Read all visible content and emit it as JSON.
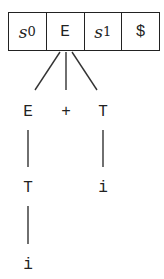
{
  "stack": {
    "cells": [
      {
        "kind": "state",
        "base": "s",
        "sub": "0"
      },
      {
        "kind": "symbol",
        "text": "E"
      },
      {
        "kind": "state",
        "base": "s",
        "sub": "1"
      },
      {
        "kind": "symbol",
        "text": "$"
      }
    ]
  },
  "tree": {
    "level1": [
      "E",
      "+",
      "T"
    ],
    "level2_left": "T",
    "level2_right": "i",
    "level3_left": "i"
  }
}
